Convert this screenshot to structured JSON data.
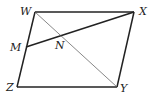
{
  "diagram": {
    "type": "parallelogram",
    "points": {
      "W": {
        "label": "W",
        "x": 35,
        "y": 12
      },
      "X": {
        "label": "X",
        "x": 134,
        "y": 12
      },
      "Y": {
        "label": "Y",
        "x": 117,
        "y": 87
      },
      "Z": {
        "label": "Z",
        "x": 17,
        "y": 87
      },
      "M": {
        "label": "M",
        "x": 26,
        "y": 47
      },
      "N": {
        "label": "N",
        "x": 61,
        "y": 34
      }
    },
    "segments": [
      {
        "from": "W",
        "to": "X",
        "style": "solid"
      },
      {
        "from": "X",
        "to": "Y",
        "style": "solid"
      },
      {
        "from": "Y",
        "to": "Z",
        "style": "solid"
      },
      {
        "from": "Z",
        "to": "W",
        "style": "solid"
      },
      {
        "from": "M",
        "to": "X",
        "style": "solid"
      },
      {
        "from": "W",
        "to": "Y",
        "style": "thin"
      }
    ]
  }
}
